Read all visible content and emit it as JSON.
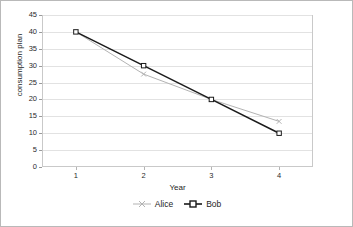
{
  "chart_data": {
    "type": "line",
    "title": "",
    "xlabel": "Year",
    "ylabel": "consumption plan",
    "categories": [
      "1",
      "2",
      "3",
      "4"
    ],
    "x": [
      1,
      2,
      3,
      4
    ],
    "series": [
      {
        "name": "Alice",
        "values": [
          40,
          27.5,
          20,
          13.5
        ],
        "color": "#b3b3b3",
        "marker": "x"
      },
      {
        "name": "Bob",
        "values": [
          40,
          30,
          20,
          10
        ],
        "color": "#1a1a1a",
        "marker": "square"
      }
    ],
    "ylim": [
      0,
      45
    ],
    "ytick_labels": [
      "0",
      "5",
      "10",
      "15",
      "20",
      "25",
      "30",
      "35",
      "40",
      "45"
    ],
    "ytick_values": [
      0,
      5,
      10,
      15,
      20,
      25,
      30,
      35,
      40,
      45
    ],
    "grid": true,
    "grid_axis": "y",
    "legend_position": "bottom"
  },
  "axes": {
    "y_title": "consumption plan",
    "x_title": "Year"
  },
  "legend": {
    "entries": [
      {
        "label": "Alice"
      },
      {
        "label": "Bob"
      }
    ]
  },
  "colors": {
    "alice": "#b3b3b3",
    "bob": "#1a1a1a",
    "gridline": "#e2e2e2",
    "plot_border": "#c9c9c9",
    "figure_border": "#b9b9b9",
    "text": "#1e1e1e"
  }
}
